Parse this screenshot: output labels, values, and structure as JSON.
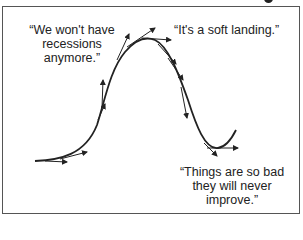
{
  "diagram": {
    "type": "business-cycle-curve",
    "quotes": {
      "boom": "“We won't have recessions anymore.”",
      "boom_lines": [
        "“We won't have",
        "recessions",
        "anymore.”"
      ],
      "peak": "“It's a soft landing.”",
      "trough": "“Things are so bad they will never improve.”",
      "trough_lines": [
        "“Things are so bad",
        "they will never",
        "improve.”"
      ]
    },
    "colors": {
      "line": "#222222",
      "border": "#555555",
      "background": "#ffffff"
    },
    "curve_points": [
      [
        35,
        161
      ],
      [
        80,
        152
      ],
      [
        100,
        120
      ],
      [
        110,
        85
      ],
      [
        125,
        55
      ],
      [
        147,
        38
      ],
      [
        170,
        50
      ],
      [
        185,
        80
      ],
      [
        200,
        120
      ],
      [
        215,
        148
      ],
      [
        235,
        130
      ]
    ],
    "tangent_arrows": 12
  }
}
